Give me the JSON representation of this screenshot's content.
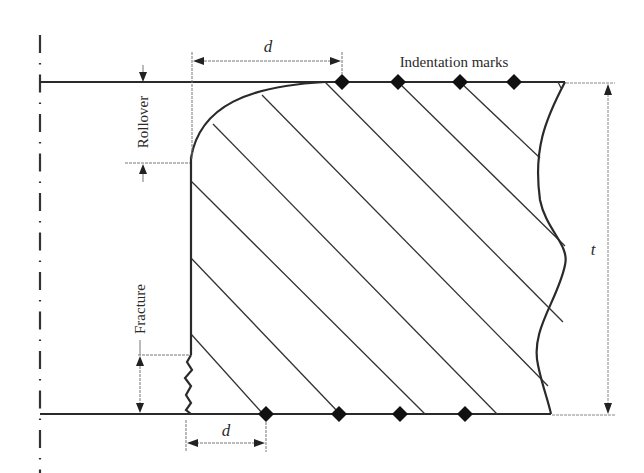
{
  "diagram": {
    "labels": {
      "indentation_marks": "Indentation marks",
      "d_top": "d",
      "d_bottom": "d",
      "rollover": "Rollover",
      "fracture": "Fracture",
      "thickness": "t"
    },
    "colors": {
      "line": "#2a2a2a",
      "dim_line": "#888888",
      "background": "#ffffff"
    },
    "indentation_marks_top_x": [
      342,
      398,
      460,
      514
    ],
    "indentation_marks_bottom_x": [
      266,
      339,
      400,
      465
    ]
  }
}
